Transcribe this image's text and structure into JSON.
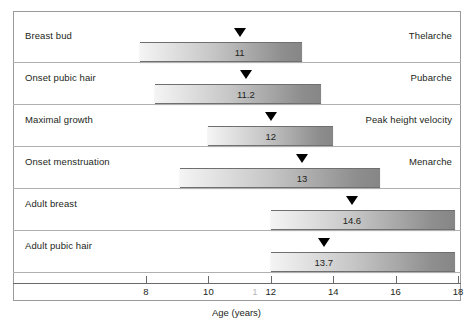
{
  "chart_data": {
    "type": "bar",
    "title": "",
    "xlabel": "Age (years)",
    "ylabel": "",
    "xlim": [
      7.0,
      18.0
    ],
    "xticks": [
      8,
      10,
      12,
      14,
      16,
      18
    ],
    "xtick_labels": [
      "8",
      "10",
      "12",
      "14",
      "16",
      "18"
    ],
    "grid": false,
    "legend": "none",
    "orientation": "horizontal-range",
    "categories": [
      "Breast bud",
      "Onset pubic hair",
      "Maximal growth",
      "Onset menstruation",
      "Adult breast",
      "Adult pubic hair"
    ],
    "series": [
      {
        "name": "Age range",
        "values": [
          [
            7.8,
            13.0
          ],
          [
            8.3,
            13.6
          ],
          [
            10.0,
            14.0
          ],
          [
            9.1,
            15.5
          ],
          [
            12.0,
            17.9
          ],
          [
            12.0,
            17.9
          ]
        ]
      },
      {
        "name": "Mean age",
        "values": [
          11,
          11.2,
          12,
          13,
          14.6,
          13.7
        ]
      }
    ],
    "rows": [
      {
        "left_label": "Breast bud",
        "right_label": "Thelarche",
        "range_start": 7.8,
        "range_end": 13.0,
        "mean": 11,
        "mean_display": "11"
      },
      {
        "left_label": "Onset pubic hair",
        "right_label": "Pubarche",
        "range_start": 8.3,
        "range_end": 13.6,
        "mean": 11.2,
        "mean_display": "11.2"
      },
      {
        "left_label": "Maximal growth",
        "right_label": "Peak height velocity",
        "range_start": 10.0,
        "range_end": 14.0,
        "mean": 12,
        "mean_display": "12"
      },
      {
        "left_label": "Onset menstruation",
        "right_label": "Menarche",
        "range_start": 9.1,
        "range_end": 15.5,
        "mean": 13,
        "mean_display": "13"
      },
      {
        "left_label": "Adult breast",
        "right_label": "",
        "range_start": 12.0,
        "range_end": 17.9,
        "mean": 14.6,
        "mean_display": "14.6"
      },
      {
        "left_label": "Adult pubic hair",
        "right_label": "",
        "range_start": 12.0,
        "range_end": 17.9,
        "mean": 13.7,
        "mean_display": "13.7"
      }
    ],
    "artifacts": {
      "stray_tick_digit": "1"
    },
    "colors": {
      "frame": "#9a9a9a",
      "row_rule": "#b0b0b0",
      "axis": "#6a6a6a",
      "text": "#231f20",
      "marker": "#000000",
      "bar_light": "#f4f4f4",
      "bar_dark": "#868686"
    }
  }
}
